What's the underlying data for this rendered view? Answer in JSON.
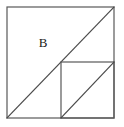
{
  "figure": {
    "type": "geometry-diagram",
    "background_color": "#ffffff",
    "stroke_color": "#595959",
    "diagonal_color": "#4a4a4a",
    "stroke_width": 1.2,
    "canvas": {
      "width": 124,
      "height": 127
    },
    "outer_square": {
      "name": "outer-square",
      "x": 7,
      "y": 7,
      "width": 107,
      "height": 111,
      "corners": {
        "top_left": [
          7,
          7
        ],
        "top_right": [
          114,
          7
        ],
        "bottom_right": [
          114,
          118
        ],
        "bottom_left": [
          7,
          118
        ]
      }
    },
    "inner_square": {
      "name": "inner-square",
      "x": 61,
      "y": 62,
      "width": 53,
      "height": 56,
      "corners": {
        "top_left": [
          61,
          62
        ],
        "top_right": [
          114,
          62
        ],
        "bottom_right": [
          114,
          118
        ],
        "bottom_left": [
          61,
          118
        ]
      }
    },
    "main_diagonal": {
      "name": "main-diagonal",
      "x1": 7,
      "y1": 118,
      "x2": 114,
      "y2": 7
    },
    "inner_diagonal": {
      "name": "inner-diagonal",
      "x1": 61,
      "y1": 118,
      "x2": 114,
      "y2": 62
    },
    "labels": [
      {
        "id": "region-b",
        "text": "B",
        "x": 43,
        "y": 44,
        "font_size": 13
      }
    ]
  }
}
